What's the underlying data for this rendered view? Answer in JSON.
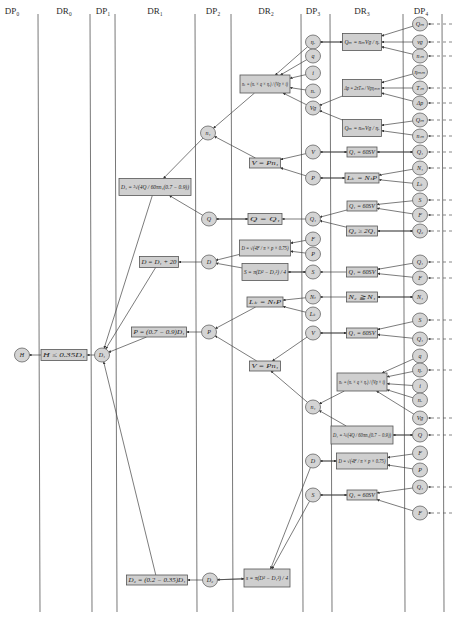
{
  "headers": [
    {
      "label": "DP₀",
      "x": 12
    },
    {
      "label": "DR₀",
      "x": 64
    },
    {
      "label": "DP₁",
      "x": 103
    },
    {
      "label": "DR₁",
      "x": 155
    },
    {
      "label": "DP₂",
      "x": 213
    },
    {
      "label": "DR₂",
      "x": 266
    },
    {
      "label": "DP₃",
      "x": 313
    },
    {
      "label": "DR₃",
      "x": 362
    },
    {
      "label": "DP₄",
      "x": 421
    }
  ],
  "column_lines": [
    38,
    90,
    115,
    195,
    231,
    301,
    330,
    403,
    442
  ],
  "nodes": [
    {
      "id": "H",
      "label": "H",
      "x": 22,
      "y": 355
    },
    {
      "id": "D1",
      "label": "D₁",
      "x": 102,
      "y": 355
    },
    {
      "id": "n1a",
      "label": "n₁",
      "x": 208,
      "y": 133
    },
    {
      "id": "Qa",
      "label": "Q",
      "x": 209,
      "y": 219
    },
    {
      "id": "Da",
      "label": "D",
      "x": 209,
      "y": 262
    },
    {
      "id": "Pa",
      "label": "P",
      "x": 209,
      "y": 332
    },
    {
      "id": "D2",
      "label": "D₂",
      "x": 210,
      "y": 580
    },
    {
      "id": "eta_r",
      "label": "ηᵣ",
      "x": 313,
      "y": 42
    },
    {
      "id": "q",
      "label": "q",
      "x": 313,
      "y": 56
    },
    {
      "id": "i",
      "label": "i",
      "x": 313,
      "y": 73
    },
    {
      "id": "n_r",
      "label": "nᵣ",
      "x": 313,
      "y": 91
    },
    {
      "id": "V_g",
      "label": "Vɡ",
      "x": 313,
      "y": 108
    },
    {
      "id": "Vb",
      "label": "V",
      "x": 313,
      "y": 152
    },
    {
      "id": "Pb",
      "label": "P",
      "x": 313,
      "y": 178
    },
    {
      "id": "Q1b",
      "label": "Q₁",
      "x": 313,
      "y": 219
    },
    {
      "id": "Fb",
      "label": "F",
      "x": 313,
      "y": 239
    },
    {
      "id": "Pc",
      "label": "P",
      "x": 313,
      "y": 254
    },
    {
      "id": "Sb",
      "label": "S",
      "x": 313,
      "y": 272
    },
    {
      "id": "Ntb",
      "label": "Nₜ",
      "x": 313,
      "y": 297
    },
    {
      "id": "Lkb",
      "label": "Lₖ",
      "x": 313,
      "y": 314
    },
    {
      "id": "Vc",
      "label": "V",
      "x": 313,
      "y": 333
    },
    {
      "id": "n1b",
      "label": "n₁",
      "x": 313,
      "y": 407
    },
    {
      "id": "Db",
      "label": "D",
      "x": 313,
      "y": 461
    },
    {
      "id": "Sc",
      "label": "S",
      "x": 313,
      "y": 495
    },
    {
      "id": "p4_1",
      "label": "Qₘ",
      "x": 420,
      "y": 24
    },
    {
      "id": "p4_2",
      "label": "vɡ",
      "x": 420,
      "y": 42
    },
    {
      "id": "p4_3",
      "label": "nₘ",
      "x": 420,
      "y": 56
    },
    {
      "id": "p4_4",
      "label": "ηₘₘ",
      "x": 420,
      "y": 72
    },
    {
      "id": "p4_5",
      "label": "Tₘ",
      "x": 420,
      "y": 88
    },
    {
      "id": "p4_6",
      "label": "Δp",
      "x": 420,
      "y": 103
    },
    {
      "id": "p4_7",
      "label": "Qₘ",
      "x": 420,
      "y": 120
    },
    {
      "id": "p4_8",
      "label": "nₘ",
      "x": 420,
      "y": 136
    },
    {
      "id": "p4_9",
      "label": "Q₁",
      "x": 420,
      "y": 152
    },
    {
      "id": "p4_10",
      "label": "N₁",
      "x": 420,
      "y": 168
    },
    {
      "id": "p4_11",
      "label": "Lₖ",
      "x": 420,
      "y": 184
    },
    {
      "id": "p4_12",
      "label": "S",
      "x": 420,
      "y": 200
    },
    {
      "id": "p4_13",
      "label": "F",
      "x": 420,
      "y": 215
    },
    {
      "id": "p4_14",
      "label": "Q₂",
      "x": 420,
      "y": 231
    },
    {
      "id": "p4_15",
      "label": "Q₁",
      "x": 420,
      "y": 262
    },
    {
      "id": "p4_16",
      "label": "F",
      "x": 420,
      "y": 278
    },
    {
      "id": "p4_17",
      "label": "N₁",
      "x": 420,
      "y": 297
    },
    {
      "id": "p4_18",
      "label": "S",
      "x": 420,
      "y": 320
    },
    {
      "id": "p4_19",
      "label": "Q₁",
      "x": 420,
      "y": 339
    },
    {
      "id": "p4_20",
      "label": "q",
      "x": 420,
      "y": 356
    },
    {
      "id": "p4_21",
      "label": "ηᵣ",
      "x": 420,
      "y": 370
    },
    {
      "id": "p4_22",
      "label": "i",
      "x": 420,
      "y": 386
    },
    {
      "id": "p4_23",
      "label": "nᵣ",
      "x": 420,
      "y": 400
    },
    {
      "id": "p4_24",
      "label": "Vɡ",
      "x": 420,
      "y": 418
    },
    {
      "id": "p4_25",
      "label": "Q",
      "x": 420,
      "y": 435
    },
    {
      "id": "p4_26",
      "label": "F",
      "x": 420,
      "y": 453
    },
    {
      "id": "p4_27",
      "label": "P",
      "x": 420,
      "y": 470
    },
    {
      "id": "p4_28",
      "label": "Q₁",
      "x": 420,
      "y": 487
    },
    {
      "id": "p4_29",
      "label": "F",
      "x": 420,
      "y": 513
    }
  ],
  "boxes": [
    {
      "id": "b_H",
      "label": "H ≤ 0.35D₁",
      "x": 64,
      "y": 355,
      "w": 46,
      "h": 11
    },
    {
      "id": "b_D1",
      "label": "D₁ = ³√(4Q / 60πn₁(0.7 − 0.9))",
      "x": 155,
      "y": 187,
      "w": 72,
      "h": 17
    },
    {
      "id": "b_D",
      "label": "D = D₁ + 20",
      "x": 159,
      "y": 262,
      "w": 39,
      "h": 11
    },
    {
      "id": "b_P",
      "label": "P = (0.7 − 0.9)D₁",
      "x": 159,
      "y": 332,
      "w": 55,
      "h": 10
    },
    {
      "id": "b_D2",
      "label": "D₂ = (0.2 − 0.35)D₁",
      "x": 157,
      "y": 580,
      "w": 61,
      "h": 10
    },
    {
      "id": "b_nt",
      "label": "nₜ = (nᵣ × q × ηᵣ) / (Vɡ × i)",
      "x": 265,
      "y": 84,
      "w": 50,
      "h": 18
    },
    {
      "id": "b_V1",
      "label": "V = Pn₁",
      "x": 265,
      "y": 163,
      "w": 31,
      "h": 10
    },
    {
      "id": "b_Q",
      "label": "Q = Q₁",
      "x": 265,
      "y": 219,
      "w": 34,
      "h": 11
    },
    {
      "id": "b_DF",
      "label": "D = √(4F / π × p × 0.75)",
      "x": 265,
      "y": 248,
      "w": 51,
      "h": 16
    },
    {
      "id": "b_S",
      "label": "S = π(D² − D₁²) / 4",
      "x": 265,
      "y": 272,
      "w": 46,
      "h": 17
    },
    {
      "id": "b_Lk",
      "label": "Lₖ = NₜP",
      "x": 265,
      "y": 302,
      "w": 36,
      "h": 10
    },
    {
      "id": "b_V2",
      "label": "V = Pn₁",
      "x": 265,
      "y": 366,
      "w": 31,
      "h": 10
    },
    {
      "id": "b_s",
      "label": "s = π(D² − D₁²) / 4",
      "x": 267,
      "y": 578,
      "w": 46,
      "h": 18
    },
    {
      "id": "b_Qm1",
      "label": "Qₘ = nₘVɡ / ηᵣ",
      "x": 362,
      "y": 42,
      "w": 39,
      "h": 17
    },
    {
      "id": "b_dp",
      "label": "Δp = 2πTₘ / Vɡηₘₘ",
      "x": 362,
      "y": 88,
      "w": 39,
      "h": 17
    },
    {
      "id": "b_Qm2",
      "label": "Qₘ = nₘVɡ / ηᵣ",
      "x": 362,
      "y": 128,
      "w": 39,
      "h": 17
    },
    {
      "id": "b_Q60a",
      "label": "Q₁ = 60SV",
      "x": 362,
      "y": 152,
      "w": 30,
      "h": 10
    },
    {
      "id": "b_Lk2",
      "label": "Lₖ = NₜP",
      "x": 362,
      "y": 178,
      "w": 34,
      "h": 10
    },
    {
      "id": "b_Q60b",
      "label": "Q₁ = 60SV",
      "x": 362,
      "y": 206,
      "w": 30,
      "h": 10
    },
    {
      "id": "b_Q2",
      "label": "Q₂ ≥ 2Q₁",
      "x": 362,
      "y": 231,
      "w": 31,
      "h": 10
    },
    {
      "id": "b_Q60c",
      "label": "Q₁ = 60SV",
      "x": 362,
      "y": 272,
      "w": 31,
      "h": 10
    },
    {
      "id": "b_N2",
      "label": "N₂ ≧ N₁",
      "x": 362,
      "y": 297,
      "w": 31,
      "h": 10
    },
    {
      "id": "b_Q60d",
      "label": "Q₁ = 60SV",
      "x": 362,
      "y": 333,
      "w": 31,
      "h": 10
    },
    {
      "id": "b_nt2",
      "label": "nₜ = (nᵣ × q × ηᵣ) / (Vɡ × i)",
      "x": 362,
      "y": 382,
      "w": 50,
      "h": 18
    },
    {
      "id": "b_D1b",
      "label": "D₁ = ³√(4Q / 60πn₁(0.7 − 0.9))",
      "x": 362,
      "y": 435,
      "w": 62,
      "h": 18
    },
    {
      "id": "b_DF2",
      "label": "D = √(4F / π × p × 0.75)",
      "x": 362,
      "y": 461,
      "w": 51,
      "h": 16
    },
    {
      "id": "b_Q60e",
      "label": "Q₁ = 60SV",
      "x": 362,
      "y": 495,
      "w": 30,
      "h": 10
    }
  ],
  "edges": [
    [
      "b_H",
      "H"
    ],
    [
      "D1",
      "b_H"
    ],
    [
      "b_D1",
      "D1"
    ],
    [
      "b_D",
      "D1"
    ],
    [
      "b_P",
      "D1"
    ],
    [
      "b_D2",
      "D1"
    ],
    [
      "n1a",
      "b_D1"
    ],
    [
      "Qa",
      "b_D1"
    ],
    [
      "Da",
      "b_D"
    ],
    [
      "Pa",
      "b_P"
    ],
    [
      "D2",
      "b_D2"
    ],
    [
      "b_nt",
      "n1a"
    ],
    [
      "b_V1",
      "n1a"
    ],
    [
      "b_Q",
      "Qa"
    ],
    [
      "Qa",
      "b_Q"
    ],
    [
      "b_DF",
      "Da"
    ],
    [
      "b_S",
      "Da"
    ],
    [
      "b_Lk",
      "Pa"
    ],
    [
      "b_V2",
      "Pa"
    ],
    [
      "b_s",
      "D2"
    ],
    [
      "D2",
      "b_s"
    ],
    [
      "eta_r",
      "b_nt"
    ],
    [
      "q",
      "b_nt"
    ],
    [
      "i",
      "b_nt"
    ],
    [
      "n_r",
      "b_nt"
    ],
    [
      "V_g",
      "b_nt"
    ],
    [
      "Vb",
      "b_V1"
    ],
    [
      "Pb",
      "b_V1"
    ],
    [
      "Q1b",
      "b_Q"
    ],
    [
      "Fb",
      "b_DF"
    ],
    [
      "Pc",
      "b_DF"
    ],
    [
      "Sb",
      "b_S"
    ],
    [
      "b_S",
      "Sb"
    ],
    [
      "Ntb",
      "b_Lk"
    ],
    [
      "Lkb",
      "b_Lk"
    ],
    [
      "Vc",
      "b_V2"
    ],
    [
      "n1b",
      "b_V2"
    ],
    [
      "Db",
      "b_s"
    ],
    [
      "Sc",
      "b_s"
    ],
    [
      "b_Qm1",
      "eta_r"
    ],
    [
      "eta_r",
      "b_Qm1"
    ],
    [
      "b_dp",
      "V_g"
    ],
    [
      "b_Qm2",
      "V_g"
    ],
    [
      "b_Q60a",
      "Vb"
    ],
    [
      "Vb",
      "b_Q60a"
    ],
    [
      "b_Lk2",
      "Pb"
    ],
    [
      "Pb",
      "b_Lk2"
    ],
    [
      "b_Q60b",
      "Q1b"
    ],
    [
      "b_Q2",
      "Q1b"
    ],
    [
      "b_Q60c",
      "Sb"
    ],
    [
      "b_N2",
      "Ntb"
    ],
    [
      "b_Q60d",
      "Vc"
    ],
    [
      "Vc",
      "b_Q60d"
    ],
    [
      "b_nt2",
      "n1b"
    ],
    [
      "b_D1b",
      "n1b"
    ],
    [
      "b_DF2",
      "Db"
    ],
    [
      "Db",
      "b_DF2"
    ],
    [
      "b_Q60e",
      "Sc"
    ],
    [
      "Sc",
      "b_Q60e"
    ],
    [
      "p4_1",
      "b_Qm1"
    ],
    [
      "p4_2",
      "b_Qm1"
    ],
    [
      "p4_3",
      "b_Qm1"
    ],
    [
      "p4_4",
      "b_dp"
    ],
    [
      "p4_5",
      "b_dp"
    ],
    [
      "p4_6",
      "b_dp"
    ],
    [
      "p4_7",
      "b_Qm2"
    ],
    [
      "p4_8",
      "b_Qm2"
    ],
    [
      "p4_9",
      "b_Q60a"
    ],
    [
      "b_Q60a",
      "p4_9"
    ],
    [
      "p4_10",
      "b_Lk2"
    ],
    [
      "p4_11",
      "b_Lk2"
    ],
    [
      "p4_12",
      "b_Q60b"
    ],
    [
      "p4_13",
      "b_Q60b"
    ],
    [
      "p4_14",
      "b_Q2"
    ],
    [
      "b_Q2",
      "p4_14"
    ],
    [
      "p4_15",
      "b_Q60c"
    ],
    [
      "p4_16",
      "b_Q60c"
    ],
    [
      "p4_17",
      "b_N2"
    ],
    [
      "b_N2",
      "p4_17"
    ],
    [
      "p4_18",
      "b_Q60d"
    ],
    [
      "p4_19",
      "b_Q60d"
    ],
    [
      "p4_20",
      "b_nt2"
    ],
    [
      "p4_21",
      "b_nt2"
    ],
    [
      "p4_22",
      "b_nt2"
    ],
    [
      "p4_23",
      "b_nt2"
    ],
    [
      "p4_24",
      "b_nt2"
    ],
    [
      "p4_25",
      "b_D1b"
    ],
    [
      "b_D1b",
      "p4_25"
    ],
    [
      "p4_26",
      "b_DF2"
    ],
    [
      "p4_27",
      "b_DF2"
    ],
    [
      "p4_28",
      "b_Q60e"
    ],
    [
      "p4_29",
      "b_Q60e"
    ]
  ],
  "dashed_inputs": [
    "p4_1",
    "p4_2",
    "p4_3",
    "p4_5",
    "p4_6",
    "p4_7",
    "p4_8",
    "p4_9",
    "p4_10",
    "p4_12",
    "p4_13",
    "p4_14",
    "p4_15",
    "p4_16",
    "p4_18",
    "p4_19",
    "p4_21",
    "p4_24",
    "p4_25",
    "p4_28",
    "p4_29"
  ]
}
